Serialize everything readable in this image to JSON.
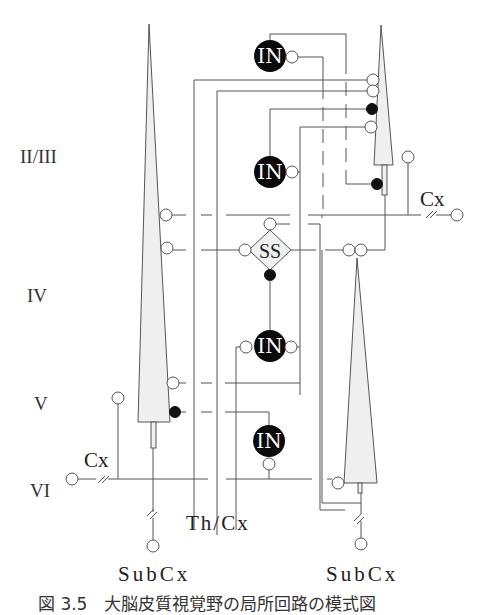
{
  "diagram": {
    "layers": [
      "II/III",
      "IV",
      "V",
      "VI"
    ],
    "cells": {
      "pyramidal_upper": "P",
      "pyramidal_lower_left": "P",
      "pyramidal_lower_right": "P",
      "spiny_stellate": "SS",
      "interneurons": [
        "IN",
        "IN",
        "IN",
        "IN"
      ]
    },
    "labels": {
      "cx_upper": "Cx",
      "cx_lower": "Cx",
      "thalamus_cortex": "Th/Cx",
      "subcx_left": "SubCx",
      "subcx_right": "SubCx"
    },
    "legend": {
      "open_circle": "excitatory synapse",
      "filled_circle": "inhibitory synapse"
    },
    "caption": "図 3.5　大脳皮質視覚野の局所回路の模式図"
  }
}
